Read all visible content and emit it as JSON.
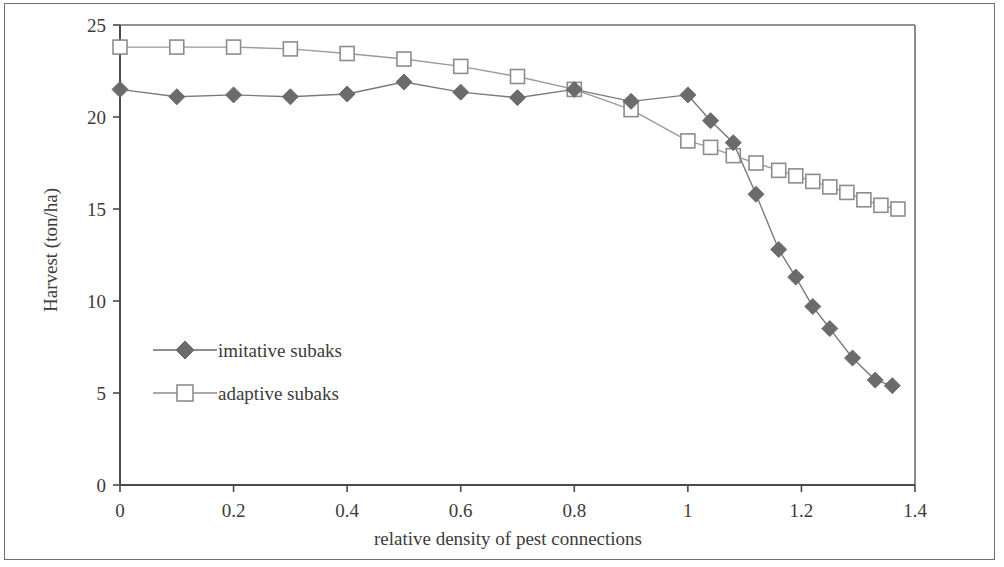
{
  "chart_data": {
    "type": "line",
    "title": "",
    "subtitle": "",
    "xlabel": "relative density of pest connections",
    "ylabel": "Harvest (ton/ha)",
    "xlim": [
      0,
      1.4
    ],
    "ylim": [
      0,
      25
    ],
    "xticks": [
      0,
      0.2,
      0.4,
      0.6,
      0.8,
      1,
      1.2,
      1.4
    ],
    "xtick_labels": [
      "0",
      "0.2",
      "0.4",
      "0.6",
      "0.8",
      "1",
      "1.2",
      "1.4"
    ],
    "yticks": [
      0,
      5,
      10,
      15,
      20,
      25
    ],
    "ytick_labels": [
      "0",
      "5",
      "10",
      "15",
      "20",
      "25"
    ],
    "grid": false,
    "legend_position": "inside-left-lower",
    "series": [
      {
        "name": "imitative subaks",
        "marker": "filled-diamond",
        "color": "#6b6b6b",
        "line_color": "#7a7a7a",
        "points": [
          {
            "x": 0.0,
            "y": 21.5
          },
          {
            "x": 0.1,
            "y": 21.1
          },
          {
            "x": 0.2,
            "y": 21.2
          },
          {
            "x": 0.3,
            "y": 21.1
          },
          {
            "x": 0.4,
            "y": 21.25
          },
          {
            "x": 0.5,
            "y": 21.9
          },
          {
            "x": 0.6,
            "y": 21.35
          },
          {
            "x": 0.7,
            "y": 21.05
          },
          {
            "x": 0.8,
            "y": 21.5
          },
          {
            "x": 0.9,
            "y": 20.85
          },
          {
            "x": 1.0,
            "y": 21.2
          },
          {
            "x": 1.04,
            "y": 19.8
          },
          {
            "x": 1.08,
            "y": 18.6
          },
          {
            "x": 1.12,
            "y": 15.8
          },
          {
            "x": 1.16,
            "y": 12.8
          },
          {
            "x": 1.19,
            "y": 11.3
          },
          {
            "x": 1.22,
            "y": 9.7
          },
          {
            "x": 1.25,
            "y": 8.5
          },
          {
            "x": 1.29,
            "y": 6.9
          },
          {
            "x": 1.33,
            "y": 5.7
          },
          {
            "x": 1.36,
            "y": 5.4
          }
        ]
      },
      {
        "name": "adaptive subaks",
        "marker": "open-square",
        "color": "#8c8c8c",
        "line_color": "#9a9a9a",
        "points": [
          {
            "x": 0.0,
            "y": 23.8
          },
          {
            "x": 0.1,
            "y": 23.8
          },
          {
            "x": 0.2,
            "y": 23.8
          },
          {
            "x": 0.3,
            "y": 23.7
          },
          {
            "x": 0.4,
            "y": 23.45
          },
          {
            "x": 0.5,
            "y": 23.15
          },
          {
            "x": 0.6,
            "y": 22.75
          },
          {
            "x": 0.7,
            "y": 22.2
          },
          {
            "x": 0.8,
            "y": 21.5
          },
          {
            "x": 0.9,
            "y": 20.4
          },
          {
            "x": 1.0,
            "y": 18.7
          },
          {
            "x": 1.04,
            "y": 18.35
          },
          {
            "x": 1.08,
            "y": 17.9
          },
          {
            "x": 1.12,
            "y": 17.5
          },
          {
            "x": 1.16,
            "y": 17.1
          },
          {
            "x": 1.19,
            "y": 16.8
          },
          {
            "x": 1.22,
            "y": 16.5
          },
          {
            "x": 1.25,
            "y": 16.2
          },
          {
            "x": 1.28,
            "y": 15.9
          },
          {
            "x": 1.31,
            "y": 15.5
          },
          {
            "x": 1.34,
            "y": 15.2
          },
          {
            "x": 1.37,
            "y": 15.0
          }
        ]
      }
    ]
  },
  "legend": {
    "entries": [
      {
        "label": "imitative subaks"
      },
      {
        "label": "adaptive subaks"
      }
    ]
  },
  "colors": {
    "frame": "#6e6e72",
    "axis": "#4a4a4a",
    "text": "#3b3b3b",
    "imitative": "#6b6b6b",
    "adaptive": "#8c8c8c",
    "background": "#ffffff"
  }
}
